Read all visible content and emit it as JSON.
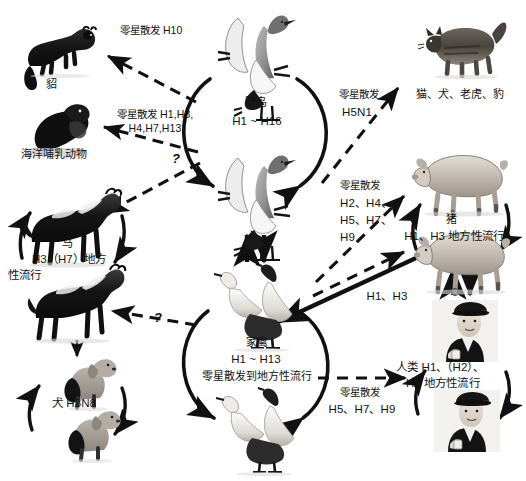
{
  "diagram": {
    "kind": "influenza-host-transmission-network",
    "language": "zh",
    "background_color": "#ffffff",
    "ink_color": "#111111"
  },
  "nodes": [
    {
      "id": "mink",
      "name_label": "貂",
      "subtype_label": "",
      "icon": "mink-icon"
    },
    {
      "id": "marine-mammals",
      "name_label": "海洋哺乳动物",
      "subtype_label": "",
      "icon": "seal-icon"
    },
    {
      "id": "horse",
      "name_label": "马",
      "subtype_label": "H3（H7）地方\n性流行",
      "icon": "horse-icon"
    },
    {
      "id": "dog",
      "name_label": "犬 H3N8",
      "subtype_label": "",
      "icon": "dog-icon"
    },
    {
      "id": "wild-birds",
      "name_label": "野鸟",
      "subtype_label": "H1 ~ H16",
      "icon": "wild-bird-icon"
    },
    {
      "id": "poultry",
      "name_label": "家禽",
      "subtype_label": "H1 ~ H13\n零星散发到地方性流行",
      "icon": "poultry-icon"
    },
    {
      "id": "felines",
      "name_label": "猫、犬、老虎、豹",
      "subtype_label": "",
      "icon": "cat-icon"
    },
    {
      "id": "pig",
      "name_label": "猪",
      "subtype_label": "H1、H3 地方性流行",
      "icon": "pig-icon"
    },
    {
      "id": "human",
      "name_label": "人类 H1、（H2）、",
      "subtype_label": "H3 地方性流行",
      "icon": "human-icon"
    }
  ],
  "edges": [
    {
      "id": "wildbirds-to-mink",
      "from": "wild-birds",
      "to": "mink",
      "style": "dashed",
      "label": "零星散发 H10"
    },
    {
      "id": "wildbirds-to-marine",
      "from": "wild-birds",
      "to": "marine-mammals",
      "style": "dashed",
      "label_line1": "零星散发 H1,H3,",
      "label_line2": "H4,H7,H13"
    },
    {
      "id": "wildbirds-to-horse",
      "from": "wild-birds",
      "to": "horse",
      "style": "dashed",
      "label": "?"
    },
    {
      "id": "wildbirds-to-felines",
      "from": "wild-birds",
      "to": "felines",
      "style": "dashed",
      "label_line1": "零星散发",
      "label_line2": "H5N1"
    },
    {
      "id": "poultry-to-pig",
      "from": "poultry",
      "to": "pig",
      "style": "dashed",
      "label_line1": "零星散发",
      "label_line2": "H2、H4、",
      "label_line3": "H5、H7、",
      "label_line4": "H9"
    },
    {
      "id": "poultry-to-horse",
      "from": "poultry",
      "to": "horse",
      "style": "dashed",
      "label": "?"
    },
    {
      "id": "poultry-to-human",
      "from": "poultry",
      "to": "human",
      "style": "dashed",
      "label_line1": "零星散发",
      "label_line2": "H5、H7、H9"
    },
    {
      "id": "human-to-poultry-solid",
      "from": "human",
      "to": "poultry",
      "style": "solid",
      "label": "H1、H3"
    },
    {
      "id": "pig-human-bidirectional",
      "from": "pig",
      "to": "human",
      "style": "solid-bidirectional",
      "label": ""
    },
    {
      "id": "wildbirds-poultry-bidirectional",
      "from": "wild-birds",
      "to": "poultry",
      "style": "solid-bidirectional",
      "label": ""
    },
    {
      "id": "horse-to-dog",
      "from": "horse",
      "to": "dog",
      "style": "solid-small",
      "label": ""
    }
  ],
  "cycles": [
    {
      "id": "horse-cycle",
      "node": "horse"
    },
    {
      "id": "dog-cycle",
      "node": "dog"
    },
    {
      "id": "wild-bird-cycle",
      "node": "wild-birds"
    },
    {
      "id": "poultry-cycle",
      "node": "poultry"
    },
    {
      "id": "pig-cycle",
      "node": "pig"
    },
    {
      "id": "human-cycle",
      "node": "human"
    }
  ],
  "labels": {
    "mink_name": "貂",
    "mink_edge": "零星散发 H10",
    "marine_name": "海洋哺乳动物",
    "marine_edge_l1": "零星散发 H1,H3,",
    "marine_edge_l2": "H4,H7,H13",
    "horse_name": "马",
    "horse_sub_l1": "H3（H7）地方",
    "horse_sub_l2": "性流行",
    "dog_name": "犬 H3N8",
    "wildbird_name": "野鸟",
    "wildbird_sub": "H1 ~ H16",
    "poultry_name": "家禽",
    "poultry_sub_l1": "H1 ~ H13",
    "poultry_sub_l2": "零星散发到地方性流行",
    "feline_name": "猫、犬、老虎、豹",
    "feline_edge_l1": "零星散发",
    "feline_edge_l2": "H5N1",
    "pig_name": "猪",
    "pig_sub": "H1、H3 地方性流行",
    "pig_edge_l1": "零星散发",
    "pig_edge_l2": "H2、H4、",
    "pig_edge_l3": "H5、H7、",
    "pig_edge_l4": "H9",
    "human_name_l1": "人类 H1、（H2）、",
    "human_name_l2": "H3 地方性流行",
    "human_edge_l1": "零星散发",
    "human_edge_l2": "H5、H7、H9",
    "h1h3_edge": "H1、H3",
    "qmark_top": "?",
    "qmark_bottom": "?"
  }
}
